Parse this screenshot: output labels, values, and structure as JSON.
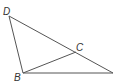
{
  "diagram": {
    "type": "geometry",
    "points": {
      "D": {
        "label": "D",
        "x": 9,
        "y": 16
      },
      "B": {
        "label": "B",
        "x": 23,
        "y": 73
      },
      "C": {
        "label": "C",
        "x": 76,
        "y": 52
      },
      "A": {
        "label": "",
        "x": 113,
        "y": 73
      }
    },
    "segments": [
      [
        "D",
        "B"
      ],
      [
        "D",
        "A"
      ],
      [
        "B",
        "A"
      ],
      [
        "B",
        "C"
      ]
    ],
    "stroke_color": "#555555",
    "label_color": "#333333"
  }
}
